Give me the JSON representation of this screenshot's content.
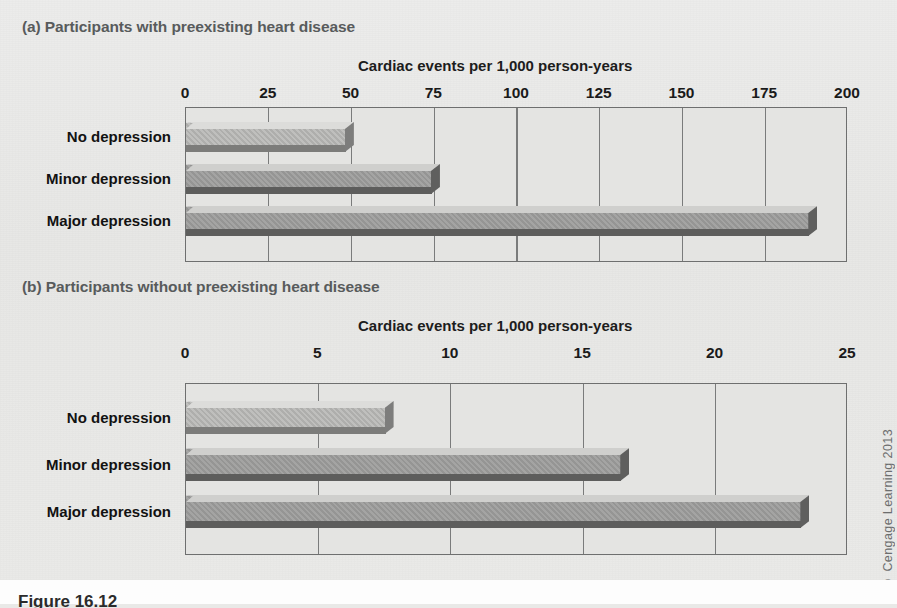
{
  "figure": {
    "caption": "Figure 16.12",
    "credit": "© Cengage Learning 2013"
  },
  "panels": [
    {
      "id": "a",
      "label": "(a) Participants with preexisting heart disease",
      "axis_title": "Cardiac events per 1,000 person-years"
    },
    {
      "id": "b",
      "label": "(b) Participants without preexisting heart disease",
      "axis_title": "Cardiac events per 1,000 person-years"
    }
  ],
  "chart_data": [
    {
      "type": "bar",
      "orientation": "horizontal",
      "title": "(a) Participants with preexisting heart disease",
      "xlabel": "Cardiac events per 1,000 person-years",
      "ylabel": "",
      "categories": [
        "No depression",
        "Minor depression",
        "Major depression"
      ],
      "values": [
        48,
        74,
        188
      ],
      "xlim": [
        0,
        200
      ],
      "xticks": [
        0,
        25,
        50,
        75,
        100,
        125,
        150,
        175,
        200
      ],
      "xticklabels": [
        "0",
        "25",
        "50",
        "75",
        "100",
        "125",
        "150",
        "175",
        "200"
      ],
      "grid": true,
      "legend": false,
      "bar_colors": [
        "#b4b4b2",
        "#9a9a99",
        "#9a9a99"
      ]
    },
    {
      "type": "bar",
      "orientation": "horizontal",
      "title": "(b) Participants without preexisting heart disease",
      "xlabel": "Cardiac events per 1,000 person-years",
      "ylabel": "",
      "categories": [
        "No depression",
        "Minor depression",
        "Major depression"
      ],
      "values": [
        7.5,
        16.4,
        23.2
      ],
      "xlim": [
        0,
        25
      ],
      "xticks": [
        0,
        5,
        10,
        15,
        20,
        25
      ],
      "xticklabels": [
        "0",
        "5",
        "10",
        "15",
        "20",
        "25"
      ],
      "grid": true,
      "legend": false,
      "bar_colors": [
        "#b4b4b2",
        "#9a9a99",
        "#9a9a99"
      ]
    }
  ]
}
